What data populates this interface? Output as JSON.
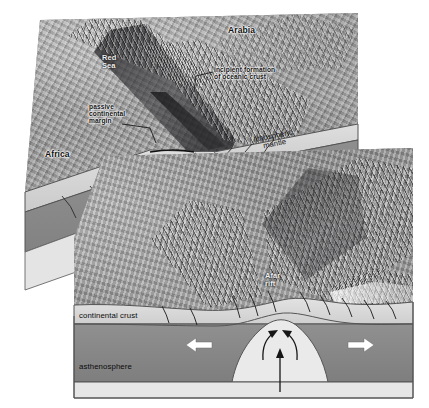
{
  "diagram": {
    "type": "block-diagram",
    "colors": {
      "continental_crust": "#d5d5d5",
      "lithospheric_mantle": "#8a8a8a",
      "asthenosphere": "#e0e0e0",
      "outline": "#4d4d4d",
      "arrow_white": "#ffffff",
      "arrow_black": "#1a1a1a",
      "label_text": "#111111"
    },
    "blocks": [
      {
        "id": "upper-block",
        "name": "Red Sea block",
        "stage": "incipient oceanic crust"
      },
      {
        "id": "lower-block",
        "name": "Afar block",
        "stage": "continental rifting"
      }
    ]
  },
  "upper_block": {
    "labels": {
      "arabia": "Arabia",
      "africa": "Africa",
      "red_sea": "Red\nSea",
      "incipient": "incipient formation\nof oceanic crust",
      "passive_margin": "passive\ncontinental\nmargin",
      "lithospheric_mantle": "lithospheric\nmantle"
    },
    "arrows": [
      {
        "name": "spreading-arrow-left",
        "direction": "left",
        "style": "white"
      },
      {
        "name": "spreading-arrow-right",
        "direction": "right",
        "style": "white"
      },
      {
        "name": "upwelling-arrow",
        "direction": "up",
        "style": "black"
      },
      {
        "name": "mantle-flow-left",
        "direction": "up-left",
        "style": "black-curved"
      },
      {
        "name": "mantle-flow-right",
        "direction": "up-right",
        "style": "black-curved"
      }
    ]
  },
  "lower_block": {
    "labels": {
      "afar_rift": "Afar\nrift",
      "continental_crust": "continental crust",
      "asthenosphere": "asthenosphere"
    },
    "arrows": [
      {
        "name": "extension-arrow-left",
        "direction": "left",
        "style": "white"
      },
      {
        "name": "extension-arrow-right",
        "direction": "right",
        "style": "white"
      },
      {
        "name": "upwelling-arrow",
        "direction": "up",
        "style": "black"
      },
      {
        "name": "mantle-flow-left",
        "direction": "up-left",
        "style": "black-curved"
      },
      {
        "name": "mantle-flow-right",
        "direction": "up-right",
        "style": "black-curved"
      }
    ]
  }
}
